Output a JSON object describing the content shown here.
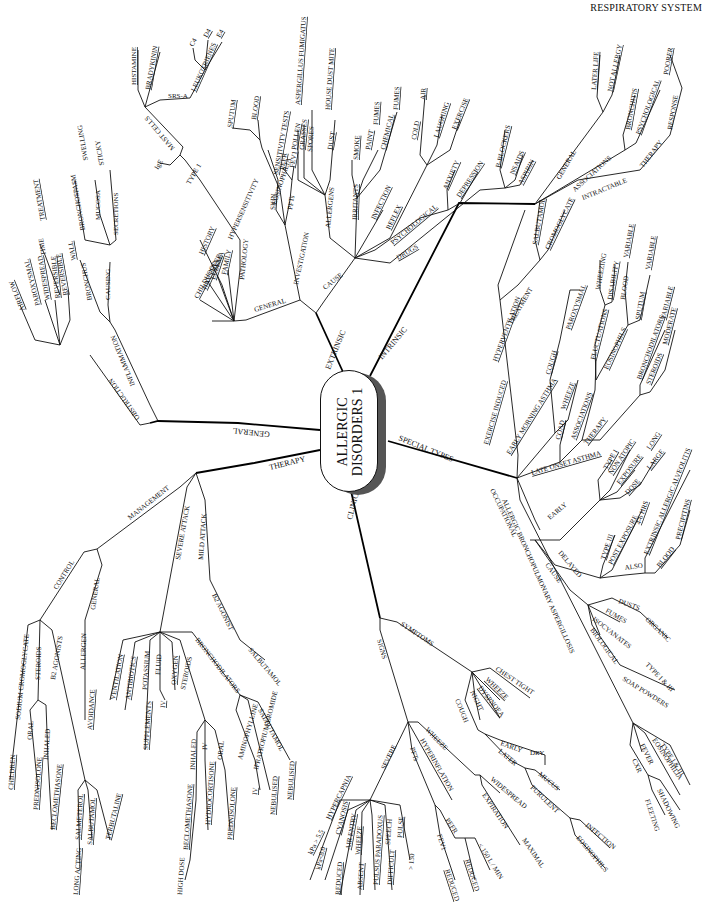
{
  "header": {
    "title": "RESPIRATORY SYSTEM"
  },
  "center": {
    "line1": "ALLERGIC",
    "line2": "DISORDERS 1"
  },
  "branches": {
    "extrinsic": {
      "label": "EXTRINSIC",
      "general": {
        "label": "GENERAL",
        "children": [
          "CHILDHOOD",
          "HAY FEVER",
          "ECZEMA",
          "FAMILY",
          "PATHOLOGY",
          "HISTORY"
        ],
        "hypersensitivity": "HYPERSENSITIVITY",
        "type1": "TYPE 1",
        "ige": "IgE",
        "mast_cells": "MAST CELLS",
        "mediators": [
          "HISTAMINE",
          "BRADYKININ"
        ],
        "srsa": "SRS-A",
        "leukotrienes": "LEUKOTRIENES",
        "leukotriene_types": [
          "C4",
          "D4",
          "E4"
        ]
      },
      "investigation": {
        "label": "INVESTIGATION",
        "eosinophilia": "EOSINOPHILIA",
        "eosinophilia_sites": [
          "SPUTUM",
          "BLOOD"
        ],
        "skin": "SKIN",
        "sensitivity_tests": "SENSITIVITY TESTS",
        "pfts": "PFTs",
        "pft_items": [
          "PEFR",
          "FEV1"
        ]
      },
      "cause": {
        "label": "CAUSE",
        "allergens": {
          "label": "ALLERGENS",
          "items": [
            "POLLEN",
            "GRASSES",
            "SPORES",
            "DUST"
          ],
          "spores_sub": "ASPERGILLUS FUMIGATUS",
          "dust_sub": "HOUSE DUST MITE"
        },
        "irritants": {
          "label": "IRRITANTS",
          "items": [
            "SMOKE",
            "PAINT",
            "CHEMICAL"
          ],
          "subs": [
            "FUMES",
            "FUMES"
          ]
        },
        "infection": "INFECTION",
        "reflex": {
          "label": "REFLEX",
          "items": [
            "COLD",
            "LAUGHING",
            "EXERCISE"
          ],
          "cold_sub": "AIR"
        },
        "psychological": {
          "label": "PSYCHOLOGICAL",
          "items": [
            "ANXIETY",
            "DEPRESSION"
          ]
        },
        "drugs": {
          "label": "DRUGS",
          "items": [
            "B-BLOCKERS",
            "NSAIDS",
            "ASPIRIN"
          ]
        }
      }
    },
    "intrinsic": {
      "label": "INTRINSIC",
      "general": {
        "label": "GENERAL",
        "items": [
          "LATER LIFE",
          "NOT ALLERGY"
        ]
      },
      "associations": {
        "label": "ASSOCIATIONS",
        "items": [
          "BRONCHITIS",
          "PSYCHOLOGICAL"
        ]
      },
      "intractable": {
        "label": "INTRACTABLE",
        "therapy": "THERAPY",
        "response": "RESPONSE",
        "poorer": "POORER"
      }
    },
    "special_types": {
      "label": "SPECIAL TYPES",
      "exercise_induced": {
        "label": "EXERCISE INDUCED",
        "hyperventilation": "HYPERVENTILATION",
        "treatment": "TREATMENT",
        "drugs": [
          "SALBUTAMOL",
          "CROMOGLYCATE"
        ]
      },
      "early_morning": {
        "label": "EARLY MORNING ASTHMA",
        "cough": "COUGH",
        "wheeze": "WHEEZE",
        "paroxysmal": "PAROXYSMAL"
      },
      "late_onset": {
        "label": "LATE ONSET ASTHMA",
        "coad": "COAD",
        "associations": "ASSOCIATIONS",
        "fluctuations": "FLUCTUATIONS",
        "fluct_items": [
          "WHEEZING",
          "DISABILITY"
        ],
        "eosinophils": "EOSINOPHILS",
        "eos_items": [
          "BLOOD",
          "SPUTUM"
        ],
        "variable": [
          "VARIABLE",
          "VARIABLE"
        ],
        "therapy": "THERAPY",
        "bronchodilators": "BRONCHODILATORS",
        "steroids": "STEROIDS",
        "moderate": "MODERATE",
        "variable3": "VARIABLE"
      },
      "occupational": {
        "label": "OCCUPATIONAL",
        "early": {
          "label": "EARLY",
          "type": "TYPE I",
          "non_atopic": "NON ATOPIC",
          "exposure": "EXPOSURE",
          "dose": "DOSE",
          "long": "LONG",
          "large": "LARGE"
        },
        "delayed": {
          "label": "DELAYED",
          "type3": "TYPE III",
          "post_exposure": "POST EXPOSURE",
          "hrs": "4-6 HRS",
          "also": "ALSO",
          "eaa": "EXTRINSIC ALLERGIC ALVEOLITIS",
          "blood": "BLOOD",
          "precipitins": "PRECIPITINS"
        },
        "cause": {
          "label": "CAUSE",
          "organic": "ORGANIC",
          "dusts": "DUSTS",
          "fumes": "FUMES",
          "isocyanates": "ISOCYANATES",
          "biological": "BIOLOGICAL",
          "type13": "TYPE I & III",
          "soap": "SOAP POWDERS"
        }
      },
      "abpa": {
        "label": "ALLERGIC BRONCHOPULMONARY ASPERGILLOSIS",
        "type13": "TYPE I & III",
        "eosinophilia": "EOSINOPHILIA",
        "fever": "FEVER",
        "cxr": "CXR",
        "shadowing": "SHADOWING",
        "fleeting": "FLEETING"
      }
    },
    "clinical": {
      "label": "CLINICAL",
      "symptoms": {
        "label": "SYMPTOMS",
        "items": [
          "CHEST TIGHT",
          "WHEEZE",
          "DYSPNOEA",
          "NIGHT",
          "COUGH"
        ],
        "cough_early": "EARLY",
        "dry": "DRY",
        "cough_later": "LATER",
        "mucus": "MUCUS",
        "purulent": "PURULENT",
        "infection": "INFECTION",
        "eosinophils": "EOSINOPHILS"
      },
      "signs": {
        "label": "SIGNS",
        "wheeze": "WHEEZE",
        "widespread": "WIDESPREAD",
        "expiration": "EXPIRATION",
        "maximal": "MAXIMAL",
        "hyperinflation": "HYPERINFLATION",
        "pfts": "PFTs",
        "pefr": "PEFR",
        "fev1": "FEV1",
        "reduced1": "REDUCED",
        "reduced2": "REDUCED",
        "lmin": "< 150 L / MIN",
        "severe": {
          "label": "SEVERE",
          "items": [
            "HYPERCAPNIA",
            "CYANOSIS",
            "AIR ENTRY",
            "WHEEZE",
            "PULSUS PARADOXUS",
            "SPEECH",
            "PULSE"
          ],
          "subs": [
            "kPa > 5.5",
            "kPa<8.0",
            "REDUCED",
            "ABSENT",
            "",
            "DIFFICULT",
            "> 130"
          ]
        }
      }
    },
    "therapy": {
      "label": "THERAPY",
      "management": {
        "label": "MANAGEMENT",
        "control": "CONTROL",
        "control_items": [
          "SODIUM CROMOGLYCATE",
          "STEROIDS",
          "B2 AGONISTS"
        ],
        "children": "CHILDREN",
        "oral": "ORAL",
        "prednisolone": "PREDNISOLONE",
        "inhaled": "INHALED",
        "beclomethasone": "BECLOMETHASONE",
        "agonists": [
          "SALMETEROL",
          "SALBUTAMOL",
          "TERBUTALINE"
        ],
        "long_acting": "LONG ACTING",
        "general": "GENERAL",
        "allergen": "ALLERGEN",
        "avoidance": "AVOIDANCE"
      },
      "severe_attack": {
        "label": "SEVERE ATTACK",
        "items": [
          "VENTILATION",
          "ANTIBIOTICS",
          "POTASSIUM",
          "FLUID",
          "OXYGEN",
          "STEROIDS",
          "BRONCHODILATORS"
        ],
        "supplements": "SUPPLEMENTS",
        "iv": "IV",
        "steroid_routes": [
          "INHALED",
          "IV",
          "ORAL"
        ],
        "steroid_drugs": [
          "BECLOMETHASONE",
          "HYDROCORTISONE",
          "PREDNISOLONE"
        ],
        "high_dose": "HIGH DOSE",
        "bronchodilator_drugs": [
          "AMINOPHYLLINE",
          "IPRATROPIUM BROMIDE",
          "SALBUTAMOL"
        ],
        "bd_routes": [
          "IV",
          "NEBULISED",
          "NEBULISED"
        ]
      },
      "mild_attack": {
        "label": "MILD ATTACK",
        "agonist": "B2 AGONIST",
        "drug": "SALBUTAMOL"
      }
    },
    "general": {
      "label": "GENERAL",
      "inflammation": {
        "label": "INFLAMMATION",
        "causing": "CAUSING",
        "bronchus": "BRONCHUS",
        "wall": "WALL",
        "bronchospasm": "BRONCHOSPASM",
        "mucosa": "MUCOSA",
        "swelling": "SWELLING",
        "secretions": "SECRETIONS",
        "sticky": "STICKY",
        "reversible": "REVERSIBLE",
        "treatment": "TREATMENT",
        "time": "TIME"
      },
      "obstruction": {
        "label": "OBSTRUCTION",
        "items": [
          "AIRFLOW",
          "PAROXYSMAL",
          "WIDESPREAD",
          "REVERSIBLE"
        ]
      }
    }
  }
}
